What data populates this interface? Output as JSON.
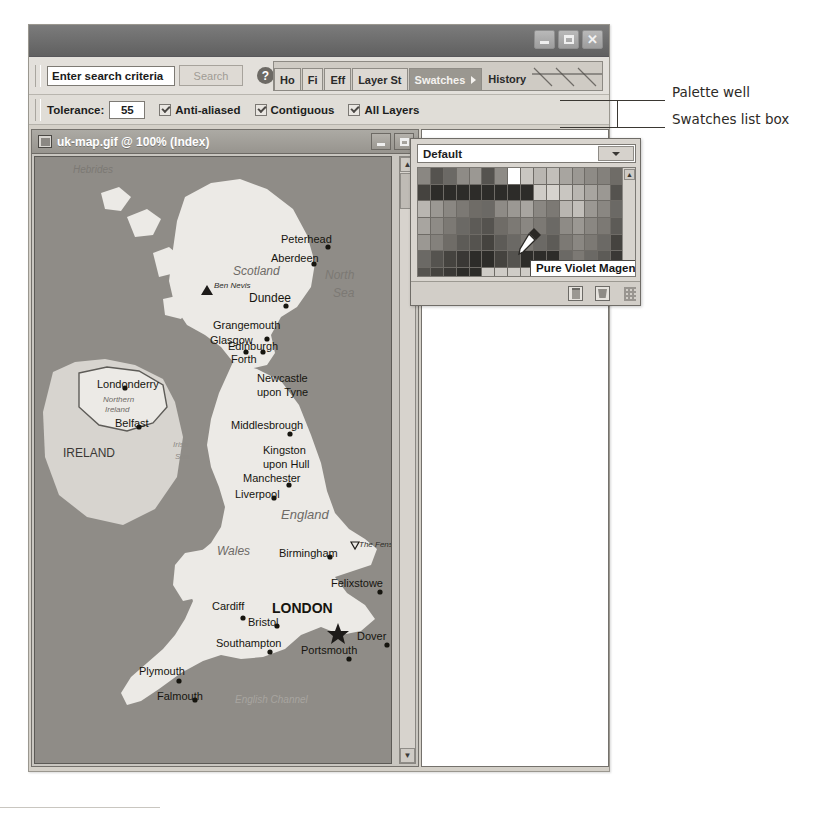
{
  "app": {
    "title": "",
    "window_buttons": [
      {
        "name": "minimize",
        "glyph": "minimize-icon"
      },
      {
        "name": "maximize",
        "glyph": "maximize-icon"
      },
      {
        "name": "close",
        "glyph": "close-icon",
        "label": "✕"
      }
    ]
  },
  "options_bar": {
    "search": {
      "value": "Enter search criteria",
      "placeholder": "Enter search criteria"
    },
    "search_button_label": "Search",
    "help_label": "?"
  },
  "tool_options": {
    "tolerance_label": "Tolerance:",
    "tolerance_value": "55",
    "checkboxes": [
      {
        "label": "Anti-aliased",
        "checked": true
      },
      {
        "label": "Contiguous",
        "checked": true
      },
      {
        "label": "All Layers",
        "checked": true
      }
    ]
  },
  "palette_well": {
    "tabs": [
      {
        "label": "Ho",
        "active": false
      },
      {
        "label": "Fi",
        "active": false
      },
      {
        "label": "Eff",
        "active": false
      },
      {
        "label": "Layer St",
        "active": false
      },
      {
        "label": "Swatches",
        "active": true
      },
      {
        "label": "History",
        "active": false
      }
    ]
  },
  "document": {
    "title": "uk-map.gif @ 100% (Index)",
    "zoom": "100%",
    "mode": "Index",
    "filename": "uk-map.gif"
  },
  "swatches_palette": {
    "listbox_value": "Default",
    "tooltip": "Pure Violet Magenta",
    "footer_icons": [
      "new-swatch-icon",
      "trash-icon"
    ],
    "grid": {
      "columns": 16,
      "rows": 7,
      "cells": [
        "#8a8782",
        "#55534f",
        "#6b6965",
        "#8e8b86",
        "#9b9893",
        "#55534f",
        "#8e8b86",
        "#ffffff",
        "#c9c6c1",
        "#b9b6b1",
        "#c2bfba",
        "#a8a5a0",
        "#9b9893",
        "#8e8b86",
        "#84817c",
        "#6f6c67",
        "#45433f",
        "#2d2c29",
        "#2d2c29",
        "#2d2c29",
        "#2d2c29",
        "#2d2c29",
        "#2d2c29",
        "#2d2c29",
        "#2d2c29",
        "#cfccc7",
        "#d6d3ce",
        "#c9c6c1",
        "#b9b6b1",
        "#a8a5a0",
        "#9b9893",
        "#55534f",
        "#b9b6b1",
        "#9b9893",
        "#8a8782",
        "#7c7974",
        "#6f6c67",
        "#6b6965",
        "#8e8b86",
        "#9b9893",
        "#a8a5a0",
        "#8a8782",
        "#7c7974",
        "#b9b6b1",
        "#c2bfba",
        "#9b9893",
        "#8a8782",
        "#6b6965",
        "#a8a5a0",
        "#8e8b86",
        "#7c7974",
        "#6b6965",
        "#5d5b57",
        "#55534f",
        "#6f6c67",
        "#7c7974",
        "#8a8782",
        "#7c7974",
        "#6b6965",
        "#8e8b86",
        "#9b9893",
        "#8a8782",
        "#7c7974",
        "#5d5b57",
        "#9b9893",
        "#84817c",
        "#6f6c67",
        "#5d5b57",
        "#55534f",
        "#45433f",
        "#5d5b57",
        "#6b6965",
        "#7c7974",
        "#6b6965",
        "#5d5b57",
        "#7c7974",
        "#8a8782",
        "#7c7974",
        "#6b6965",
        "#45433f",
        "#6b6965",
        "#55534f",
        "#45433f",
        "#3a3835",
        "#2d2c29",
        "#2d2c29",
        "#45433f",
        "#55534f",
        "#2d2c29",
        "#2d2c29",
        "#2d2c29",
        "#6b6965",
        "#7c7974",
        "#6b6965",
        "#5d5b57",
        "#3a3835",
        "#55534f",
        "#45433f",
        "#3a3835",
        "#2d2c29",
        "#2d2c29",
        "#cfccc7",
        "#cfccc7",
        "#cfccc7",
        "#cfccc7",
        "#cfccc7",
        "#cfccc7",
        "#cfccc7",
        "#cfccc7",
        "#cfccc7",
        "#cfccc7",
        "#6b6965"
      ]
    }
  },
  "map": {
    "places": [
      {
        "name": "Peterhead",
        "x": 246,
        "y": 86,
        "dx": 47,
        "dy": 4,
        "size": 11,
        "weight": "normal",
        "dot": true
      },
      {
        "name": "Aberdeen",
        "x": 236,
        "y": 105,
        "dx": 43,
        "dy": 2,
        "size": 11,
        "weight": "normal",
        "dot": true
      },
      {
        "name": "Dundee",
        "x": 214,
        "y": 145,
        "dx": 37,
        "dy": 4,
        "size": 12,
        "weight": "normal",
        "dot": true
      },
      {
        "name": "Grangemouth",
        "x": 178,
        "y": 172,
        "dx": 54,
        "dy": 10,
        "size": 11,
        "weight": "normal",
        "dot": true
      },
      {
        "name": "Glasgow",
        "x": 175,
        "y": 187,
        "dx": 36,
        "dy": 8,
        "size": 11,
        "weight": "normal",
        "dot": true
      },
      {
        "name": "Edinburgh",
        "x": 193,
        "y": 193,
        "dx": 35,
        "dy": 2,
        "size": 11,
        "weight": "normal",
        "dot": true
      },
      {
        "name": "Forth",
        "x": 196,
        "y": 206,
        "dx": 0,
        "dy": 0,
        "size": 11,
        "weight": "normal",
        "dot": false
      },
      {
        "name": "Newcastle",
        "x": 222,
        "y": 225,
        "dx": 0,
        "dy": 0,
        "size": 11,
        "weight": "normal",
        "dot": false
      },
      {
        "name": "upon Tyne",
        "x": 222,
        "y": 239,
        "dx": 0,
        "dy": 0,
        "size": 11,
        "weight": "normal",
        "dot": false
      },
      {
        "name": "Londonderry",
        "x": 62,
        "y": 231,
        "dx": 28,
        "dy": 0,
        "size": 11,
        "weight": "normal",
        "dot": true
      },
      {
        "name": "Belfast",
        "x": 80,
        "y": 270,
        "dx": 24,
        "dy": 0,
        "size": 11,
        "weight": "normal",
        "dot": true
      },
      {
        "name": "Middlesbrough",
        "x": 196,
        "y": 272,
        "dx": 59,
        "dy": 5,
        "size": 11,
        "weight": "normal",
        "dot": true
      },
      {
        "name": "Kingston",
        "x": 228,
        "y": 297,
        "dx": 0,
        "dy": 0,
        "size": 11,
        "weight": "normal",
        "dot": false
      },
      {
        "name": "upon Hull",
        "x": 228,
        "y": 311,
        "dx": 0,
        "dy": 0,
        "size": 11,
        "weight": "normal",
        "dot": false
      },
      {
        "name": "Manchester",
        "x": 208,
        "y": 325,
        "dx": 46,
        "dy": 3,
        "size": 11,
        "weight": "normal",
        "dot": true
      },
      {
        "name": "Liverpool",
        "x": 200,
        "y": 341,
        "dx": 39,
        "dy": 0,
        "size": 11,
        "weight": "normal",
        "dot": true
      },
      {
        "name": "Birmingham",
        "x": 244,
        "y": 400,
        "dx": 51,
        "dy": 0,
        "size": 11,
        "weight": "normal",
        "dot": true
      },
      {
        "name": "Felixstowe",
        "x": 296,
        "y": 430,
        "dx": 49,
        "dy": 5,
        "size": 11,
        "weight": "normal",
        "dot": true
      },
      {
        "name": "Cardiff",
        "x": 177,
        "y": 453,
        "dx": 31,
        "dy": 8,
        "size": 11,
        "weight": "normal",
        "dot": true
      },
      {
        "name": "LONDON",
        "x": 237,
        "y": 456,
        "dx": 57,
        "dy": 10,
        "size": 14,
        "weight": "bold",
        "dot": false
      },
      {
        "name": "Bristol",
        "x": 213,
        "y": 469,
        "dx": 29,
        "dy": 0,
        "size": 11,
        "weight": "normal",
        "dot": true
      },
      {
        "name": "Dover",
        "x": 322,
        "y": 483,
        "dx": 30,
        "dy": 5,
        "size": 11,
        "weight": "normal",
        "dot": true
      },
      {
        "name": "Southampton",
        "x": 181,
        "y": 490,
        "dx": 54,
        "dy": 5,
        "size": 11,
        "weight": "normal",
        "dot": true
      },
      {
        "name": "Portsmouth",
        "x": 266,
        "y": 497,
        "dx": 48,
        "dy": 5,
        "size": 11,
        "weight": "normal",
        "dot": true
      },
      {
        "name": "Plymouth",
        "x": 104,
        "y": 518,
        "dx": 40,
        "dy": 6,
        "size": 11,
        "weight": "normal",
        "dot": true
      },
      {
        "name": "Falmouth",
        "x": 122,
        "y": 543,
        "dx": 38,
        "dy": 0,
        "size": 11,
        "weight": "normal",
        "dot": true
      }
    ],
    "regions": [
      {
        "name": "Scotland",
        "x": 198,
        "y": 118,
        "size": 12,
        "style": "italic",
        "color": "#6e6b66"
      },
      {
        "name": "North",
        "x": 290,
        "y": 122,
        "size": 12,
        "style": "italic",
        "color": "#7c7974"
      },
      {
        "name": "Sea",
        "x": 298,
        "y": 140,
        "size": 12,
        "style": "italic",
        "color": "#7c7974"
      },
      {
        "name": "Ben Nevis",
        "x": 179,
        "y": 131,
        "size": 8,
        "style": "italic",
        "color": "#2d2c29"
      },
      {
        "name": "Northern",
        "x": 68,
        "y": 245,
        "size": 8,
        "style": "italic",
        "color": "#6e6b66"
      },
      {
        "name": "Ireland",
        "x": 70,
        "y": 255,
        "size": 8,
        "style": "italic",
        "color": "#6e6b66"
      },
      {
        "name": "IRELAND",
        "x": 28,
        "y": 300,
        "size": 12,
        "style": "normal",
        "color": "#3a3835"
      },
      {
        "name": "Irish",
        "x": 138,
        "y": 290,
        "size": 8,
        "style": "italic",
        "color": "#8e8b86"
      },
      {
        "name": "Sea",
        "x": 140,
        "y": 302,
        "size": 8,
        "style": "italic",
        "color": "#8e8b86"
      },
      {
        "name": "England",
        "x": 246,
        "y": 362,
        "size": 13,
        "style": "italic",
        "color": "#6e6b66"
      },
      {
        "name": "Wales",
        "x": 182,
        "y": 398,
        "size": 12,
        "style": "italic",
        "color": "#6e6b66"
      },
      {
        "name": "The Fens",
        "x": 324,
        "y": 390,
        "size": 8,
        "style": "italic",
        "color": "#2d2c29"
      },
      {
        "name": "Hebrides",
        "x": 38,
        "y": 16,
        "size": 10,
        "style": "italic",
        "color": "#7c7974"
      },
      {
        "name": "English Channel",
        "x": 200,
        "y": 546,
        "size": 10,
        "style": "italic",
        "color": "#a8a5a0"
      }
    ]
  },
  "annotations": [
    {
      "label": "Palette well",
      "x": 672,
      "y": 92
    },
    {
      "label": "Swatches list box",
      "x": 672,
      "y": 119
    }
  ]
}
